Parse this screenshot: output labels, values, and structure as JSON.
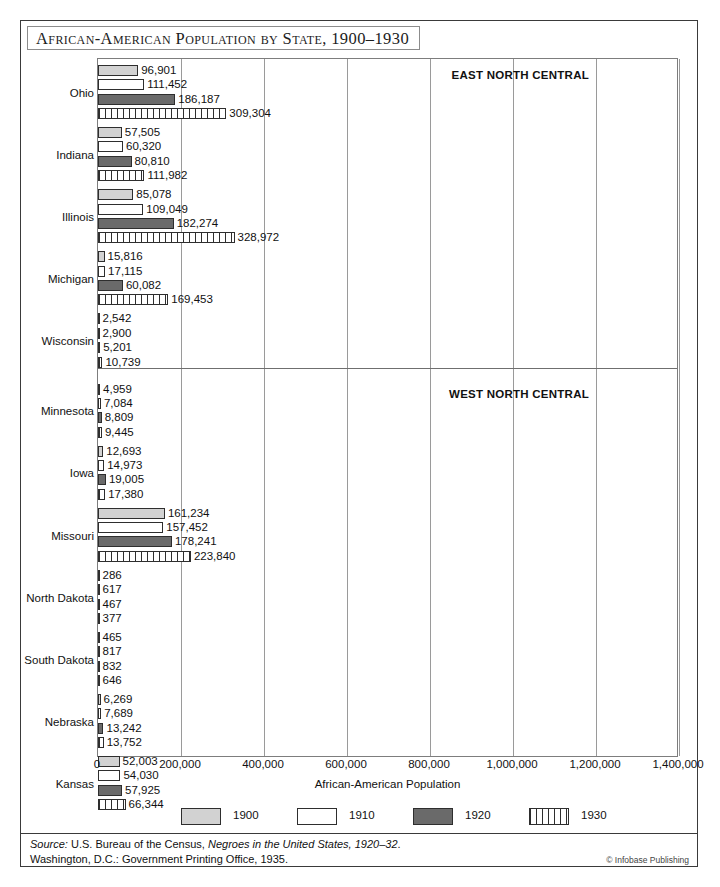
{
  "title": "African-American Population by State, 1900–1930",
  "chart_data": {
    "type": "bar",
    "orientation": "horizontal",
    "title": "African-American Population by State, 1900–1930",
    "xlabel": "African-American Population",
    "ylabel": "",
    "xlim": [
      0,
      1400000
    ],
    "xticks": [
      "0",
      "200,000",
      "400,000",
      "600,000",
      "800,000",
      "1,000,000",
      "1,200,000",
      "1,400,000"
    ],
    "xtick_values": [
      0,
      200000,
      400000,
      600000,
      800000,
      1000000,
      1200000,
      1400000
    ],
    "grid": true,
    "legend_position": "bottom",
    "series": [
      {
        "name": "1900",
        "style": "light-gray-solid",
        "color": "#d2d2d2"
      },
      {
        "name": "1910",
        "style": "white-solid",
        "color": "#ffffff"
      },
      {
        "name": "1920",
        "style": "dark-gray-solid",
        "color": "#6a6a6a"
      },
      {
        "name": "1930",
        "style": "vertical-hatch",
        "color": "#ffffff"
      }
    ],
    "regions": [
      {
        "name": "EAST NORTH CENTRAL",
        "categories": [
          "Ohio",
          "Indiana",
          "Illinois",
          "Michigan",
          "Wisconsin"
        ],
        "rows": [
          {
            "state": "Ohio",
            "values": [
              96901,
              111452,
              186187,
              309304
            ],
            "labels": [
              "96,901",
              "111,452",
              "186,187",
              "309,304"
            ]
          },
          {
            "state": "Indiana",
            "values": [
              57505,
              60320,
              80810,
              111982
            ],
            "labels": [
              "57,505",
              "60,320",
              "80,810",
              "111,982"
            ]
          },
          {
            "state": "Illinois",
            "values": [
              85078,
              109049,
              182274,
              328972
            ],
            "labels": [
              "85,078",
              "109,049",
              "182,274",
              "328,972"
            ]
          },
          {
            "state": "Michigan",
            "values": [
              15816,
              17115,
              60082,
              169453
            ],
            "labels": [
              "15,816",
              "17,115",
              "60,082",
              "169,453"
            ]
          },
          {
            "state": "Wisconsin",
            "values": [
              2542,
              2900,
              5201,
              10739
            ],
            "labels": [
              "2,542",
              "2,900",
              "5,201",
              "10,739"
            ]
          }
        ]
      },
      {
        "name": "WEST NORTH CENTRAL",
        "categories": [
          "Minnesota",
          "Iowa",
          "Missouri",
          "North Dakota",
          "South Dakota",
          "Nebraska",
          "Kansas"
        ],
        "rows": [
          {
            "state": "Minnesota",
            "values": [
              4959,
              7084,
              8809,
              9445
            ],
            "labels": [
              "4,959",
              "7,084",
              "8,809",
              "9,445"
            ]
          },
          {
            "state": "Iowa",
            "values": [
              12693,
              14973,
              19005,
              17380
            ],
            "labels": [
              "12,693",
              "14,973",
              "19,005",
              "17,380"
            ]
          },
          {
            "state": "Missouri",
            "values": [
              161234,
              157452,
              178241,
              223840
            ],
            "labels": [
              "161,234",
              "157,452",
              "178,241",
              "223,840"
            ]
          },
          {
            "state": "North Dakota",
            "values": [
              286,
              617,
              467,
              377
            ],
            "labels": [
              "286",
              "617",
              "467",
              "377"
            ]
          },
          {
            "state": "South Dakota",
            "values": [
              465,
              817,
              832,
              646
            ],
            "labels": [
              "465",
              "817",
              "832",
              "646"
            ]
          },
          {
            "state": "Nebraska",
            "values": [
              6269,
              7689,
              13242,
              13752
            ],
            "labels": [
              "6,269",
              "7,689",
              "13,242",
              "13,752"
            ]
          },
          {
            "state": "Kansas",
            "values": [
              52003,
              54030,
              57925,
              66344
            ],
            "labels": [
              "52,003",
              "54,030",
              "57,925",
              "66,344"
            ]
          }
        ]
      }
    ]
  },
  "legend": [
    {
      "label": "1900",
      "key": "y1900"
    },
    {
      "label": "1910",
      "key": "y1910"
    },
    {
      "label": "1920",
      "key": "y1920"
    },
    {
      "label": "1930",
      "key": "y1930"
    }
  ],
  "source": {
    "line1_prefix": "Source:",
    "line1_body": " U.S. Bureau of the Census, ",
    "line1_title": "Negroes in the United States, 1920–32",
    "line1_suffix": ".",
    "line2": "Washington, D.C.: Government Printing Office, 1935.",
    "credit": "© Infobase Publishing"
  }
}
